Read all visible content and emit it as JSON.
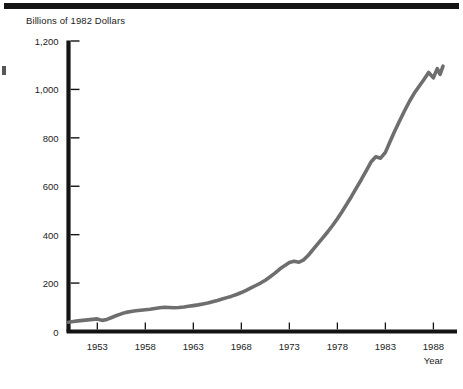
{
  "figure": {
    "top_rule": "horizontal-rule",
    "margin_artifact": "page-edge-ink-fragment"
  },
  "chart_data": {
    "type": "line",
    "title": "",
    "ylabel": "Billions of 1982 Dollars",
    "xlabel": "Year",
    "xlim": [
      1950,
      1989
    ],
    "ylim": [
      0,
      1200
    ],
    "ytick_values": [
      0,
      200,
      400,
      600,
      800,
      1000,
      1200
    ],
    "ytick_labels": [
      "0",
      "200",
      "400",
      "600",
      "800",
      "1,000",
      "1,200"
    ],
    "xtick_values": [
      1953,
      1958,
      1963,
      1968,
      1973,
      1978,
      1983,
      1988
    ],
    "xtick_labels": [
      "1953",
      "1958",
      "1963",
      "1968",
      "1973",
      "1978",
      "1983",
      "1988"
    ],
    "grid": false,
    "legend": null,
    "line_color": "#6e6e6e",
    "line_width": 3.6,
    "axis_color": "#141414",
    "series": [
      {
        "name": "Real expenditure",
        "x": [
          1950.0,
          1950.5,
          1951.0,
          1951.5,
          1952.0,
          1952.5,
          1953.0,
          1953.5,
          1954.0,
          1954.5,
          1955.0,
          1955.5,
          1956.0,
          1956.5,
          1957.0,
          1957.5,
          1958.0,
          1958.5,
          1959.0,
          1959.5,
          1960.0,
          1960.5,
          1961.0,
          1961.5,
          1962.0,
          1962.5,
          1963.0,
          1963.5,
          1964.0,
          1964.5,
          1965.0,
          1965.5,
          1966.0,
          1966.5,
          1967.0,
          1967.5,
          1968.0,
          1968.5,
          1969.0,
          1969.5,
          1970.0,
          1970.5,
          1971.0,
          1971.5,
          1972.0,
          1972.5,
          1973.0,
          1973.5,
          1974.0,
          1974.5,
          1975.0,
          1975.5,
          1976.0,
          1976.5,
          1977.0,
          1977.5,
          1978.0,
          1978.5,
          1979.0,
          1979.5,
          1980.0,
          1980.5,
          1981.0,
          1981.5,
          1982.0,
          1982.5,
          1983.0,
          1983.5,
          1984.0,
          1984.5,
          1985.0,
          1985.5,
          1986.0,
          1986.5,
          1987.0,
          1987.5,
          1988.0,
          1988.4,
          1988.7,
          1989.0
        ],
        "y": [
          38,
          41,
          44,
          46,
          48,
          50,
          52,
          46,
          50,
          58,
          66,
          73,
          79,
          83,
          86,
          88,
          90,
          92,
          95,
          98,
          100,
          99,
          98,
          99,
          101,
          104,
          107,
          110,
          114,
          118,
          123,
          128,
          134,
          140,
          146,
          153,
          161,
          170,
          180,
          190,
          200,
          212,
          226,
          241,
          258,
          272,
          285,
          290,
          286,
          296,
          316,
          340,
          364,
          388,
          412,
          438,
          466,
          496,
          528,
          560,
          594,
          628,
          664,
          700,
          722,
          716,
          740,
          786,
          830,
          872,
          912,
          950,
          984,
          1012,
          1040,
          1070,
          1048,
          1086,
          1062,
          1096
        ]
      }
    ]
  }
}
